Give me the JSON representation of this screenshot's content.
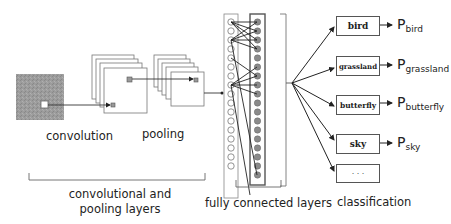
{
  "stages": {
    "convolution_label": "convolution",
    "pooling_label": "pooling",
    "conv_pool_group_label_line1": "convolutional and",
    "conv_pool_group_label_line2": "pooling layers",
    "fully_connected_label": "fully connected layers",
    "classification_label": "classification"
  },
  "classes": [
    {
      "label": "bird",
      "prob_base": "P",
      "prob_sub": "bird"
    },
    {
      "label": "grassland",
      "prob_base": "P",
      "prob_sub": "grassland"
    },
    {
      "label": "butterfly",
      "prob_base": "P",
      "prob_sub": "butterfly"
    },
    {
      "label": "sky",
      "prob_base": "P",
      "prob_sub": "sky"
    },
    {
      "label": "· · ·",
      "prob_base": "",
      "prob_sub": ""
    }
  ],
  "colors": {
    "input_image": "#9a9a9a",
    "line": "#333333",
    "node_filled": "#8a8a8a",
    "bracket": "#666666"
  }
}
